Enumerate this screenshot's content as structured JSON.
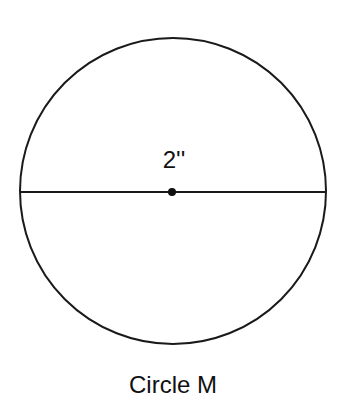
{
  "diagram": {
    "shape": "circle",
    "name": "Circle M",
    "diameter_label": "2''",
    "caption": "Circle M",
    "stroke_color": "#1a1a1a",
    "background": "#ffffff"
  }
}
